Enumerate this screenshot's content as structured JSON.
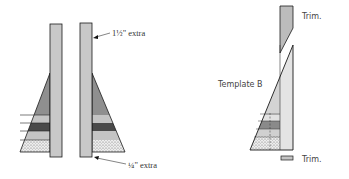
{
  "labels": {
    "extra_top": "1½\" extra",
    "extra_bottom": "¼\" extra",
    "template_b": "Template B",
    "trim_top": "Trim.",
    "trim_bottom": "Trim."
  },
  "colors": {
    "strip_fill": "#c8c8c8",
    "triangle_mid": "#8f8f8f",
    "band_light": "#c4c4c4",
    "band_dark": "#555555",
    "dotted_fill": "#e6e6e6",
    "template_fill": "#d6d6d6",
    "outline": "#1a1a1a"
  }
}
